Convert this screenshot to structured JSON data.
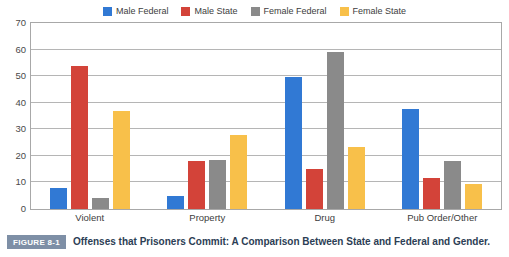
{
  "chart_data": {
    "type": "bar",
    "title": "",
    "xlabel": "",
    "ylabel": "",
    "ylim": [
      0,
      70
    ],
    "ytick_step": 10,
    "yticks": [
      0,
      10,
      20,
      30,
      40,
      50,
      60,
      70
    ],
    "grid": true,
    "legend_position": "top-center",
    "categories": [
      "Violent",
      "Property",
      "Drug",
      "Pub Order/Other"
    ],
    "series": [
      {
        "name": "Male Federal",
        "color": "#3179d4",
        "values": [
          8,
          5,
          49.5,
          37.5
        ]
      },
      {
        "name": "Male State",
        "color": "#d34339",
        "values": [
          54,
          18,
          15,
          11.5
        ]
      },
      {
        "name": "Female Federal",
        "color": "#8a8a8a",
        "values": [
          4,
          18.5,
          59,
          18
        ]
      },
      {
        "name": "Female State",
        "color": "#f8c04a",
        "values": [
          37,
          28,
          23.5,
          9.5
        ]
      }
    ]
  },
  "caption": {
    "badge": "FIGURE 8-1",
    "text": "Offenses that Prisoners Commit: A Comparison Between State and Federal and Gender."
  },
  "colors": {
    "male_federal": "#3179d4",
    "male_state": "#d34339",
    "female_federal": "#8a8a8a",
    "female_state": "#f8c04a",
    "axis": "#a8a8a8",
    "grid": "#b5b5b5",
    "badge_bg": "#7e8fa6",
    "caption_text": "#2c3e55"
  }
}
